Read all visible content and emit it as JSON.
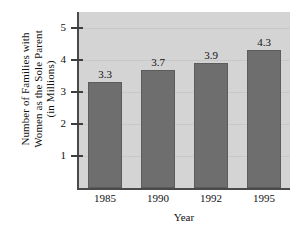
{
  "chart_data": {
    "type": "bar",
    "title": "",
    "categories": [
      "1985",
      "1990",
      "1992",
      "1995"
    ],
    "values": [
      3.3,
      3.7,
      3.9,
      4.3
    ],
    "value_labels": [
      "3.3",
      "3.7",
      "3.9",
      "4.3"
    ],
    "xlabel": "Year",
    "ylabel": "Number of Families with Women as the Sole Parent (in Millions)",
    "ylabel_lines": [
      "Number of Families with",
      "Women as the Sole Parent",
      "(in Millions)"
    ],
    "ytick_labels": [
      "1",
      "2",
      "3",
      "4",
      "5"
    ],
    "ytick_values": [
      1,
      2,
      3,
      4,
      5
    ],
    "ylim": [
      0,
      5.5
    ],
    "grid": true,
    "legend": "none",
    "colors": {
      "bar_fill": "#6e6e6e",
      "bar_edge": "#5c5c5c",
      "plot_background": "#d4d4d4",
      "axis": "#4a4a4a",
      "text": "#111111",
      "gridline": "#c8c8c8"
    }
  }
}
